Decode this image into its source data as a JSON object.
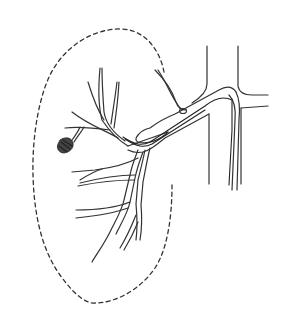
{
  "figure": {
    "background": "#ffffff",
    "stroke_color": "#333333",
    "labels": []
  },
  "elements": {
    "kidney_outline": {
      "name": "kidney-outline",
      "style": "dashed"
    },
    "aorta": {
      "name": "aorta"
    },
    "renal_artery": {
      "name": "renal-artery"
    },
    "catheter": {
      "name": "catheter"
    },
    "coil": {
      "name": "embolization-coil"
    },
    "branches": {
      "name": "segmental-branches"
    }
  }
}
